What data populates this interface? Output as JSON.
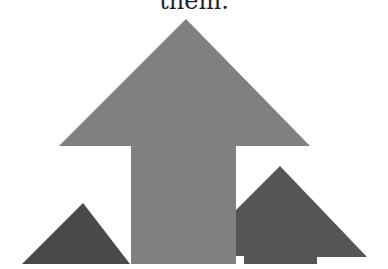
{
  "document": {
    "caption_text": "them."
  },
  "figure": {
    "colors": {
      "large_arrow": "#808080",
      "left_triangle": "#4a4a4a",
      "right_arrow": "#565656",
      "background": "#ffffff"
    },
    "shapes": [
      {
        "name": "large-up-arrow",
        "points": "186,19 310,146 236,146 236,264 131,264 131,146 59,146"
      },
      {
        "name": "small-left-triangle",
        "points": "83,203 130,264 22,264"
      },
      {
        "name": "right-up-arrow",
        "points": "280,166 367,257 317,257 317,264 244,264 244,256 236,256 236,210"
      }
    ]
  }
}
